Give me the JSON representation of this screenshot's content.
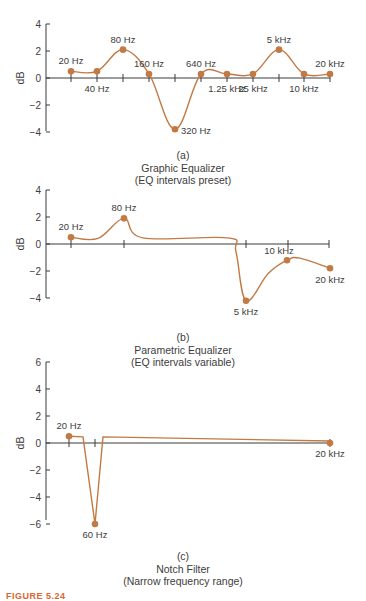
{
  "colors": {
    "curve": "#C27A45",
    "axis": "#3a3a3a",
    "text": "#3c3c3c",
    "figure_label": "#D9662E"
  },
  "figure_label": "FIGURE 5.24",
  "chart_data": [
    {
      "type": "line",
      "panel": "(a)",
      "title": "Graphic Equalizer",
      "subtitle": "(EQ intervals preset)",
      "xlabel": "",
      "ylabel": "dB",
      "ylim": [
        -4,
        4
      ],
      "yticks": [
        4,
        2,
        0,
        -2,
        -4
      ],
      "grid": false,
      "x": [
        "20 Hz",
        "40 Hz",
        "80 Hz",
        "160 Hz",
        "320 Hz",
        "640 Hz",
        "1.25 kHz",
        "25 kHz",
        "5 kHz",
        "10 kHz",
        "20 kHz"
      ],
      "values": [
        0.5,
        0.5,
        2.1,
        0.3,
        -3.8,
        0.3,
        0.3,
        0.3,
        2.1,
        0.3,
        0.3
      ],
      "label_positions": [
        "above",
        "below",
        "above",
        "above",
        "right",
        "above",
        "below",
        "below",
        "above",
        "below",
        "above"
      ]
    },
    {
      "type": "line",
      "panel": "(b)",
      "title": "Parametric Equalizer",
      "subtitle": "(EQ intervals variable)",
      "xlabel": "",
      "ylabel": "dB",
      "ylim": [
        -4,
        4
      ],
      "yticks": [
        4,
        2,
        0,
        -2,
        -4
      ],
      "grid": false,
      "x": [
        "20 Hz",
        "80 Hz",
        "5 kHz",
        "10 kHz",
        "20 kHz"
      ],
      "values": [
        0.5,
        1.9,
        -4.2,
        -1.2,
        -1.8
      ],
      "label_positions": [
        "above",
        "above",
        "below",
        "above",
        "below"
      ]
    },
    {
      "type": "line",
      "panel": "(c)",
      "title": "Notch Filter",
      "subtitle": "(Narrow frequency range)",
      "xlabel": "",
      "ylabel": "dB",
      "ylim": [
        -6,
        6
      ],
      "yticks": [
        6,
        4,
        2,
        0,
        -2,
        -4,
        -6
      ],
      "grid": false,
      "x": [
        "20 Hz",
        "60 Hz",
        "20 kHz"
      ],
      "values": [
        0.5,
        -6,
        0
      ],
      "label_positions": [
        "above",
        "below",
        "below"
      ]
    }
  ],
  "captions": [
    {
      "panel": "(a)",
      "title": "Graphic Equalizer",
      "subtitle": "(EQ intervals preset)"
    },
    {
      "panel": "(b)",
      "title": "Parametric Equalizer",
      "subtitle": "(EQ intervals variable)"
    },
    {
      "panel": "(c)",
      "title": "Notch Filter",
      "subtitle": "(Narrow frequency range)"
    }
  ]
}
